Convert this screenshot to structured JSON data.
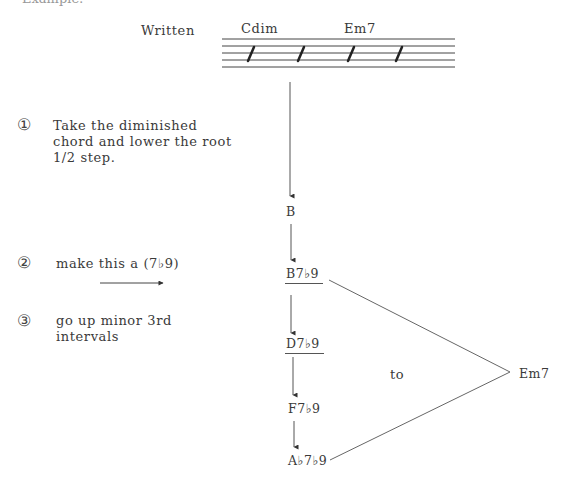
{
  "header": {
    "clipped_title": "Example:",
    "written_label": "Written"
  },
  "staff": {
    "chords": [
      "Cdim",
      "Em7"
    ],
    "slashes": 4
  },
  "steps": [
    {
      "number": "①",
      "lines": [
        "Take the diminished",
        "chord and lower the root",
        "1/2 step."
      ]
    },
    {
      "number": "②",
      "lines": [
        "make this a (7♭9)"
      ]
    },
    {
      "number": "③",
      "lines": [
        "go up minor 3rd",
        "intervals"
      ]
    }
  ],
  "flow": {
    "root": "B",
    "chain": [
      "B7♭9",
      "D7♭9",
      "F7♭9",
      "A♭7♭9"
    ],
    "connector": "to",
    "target": "Em7"
  }
}
